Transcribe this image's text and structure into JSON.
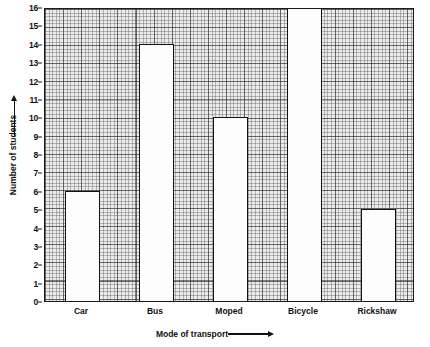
{
  "chart_data": {
    "type": "bar",
    "title": "",
    "categories": [
      "Car",
      "Bus",
      "Moped",
      "Bicycle",
      "Rickshaw"
    ],
    "values": [
      6,
      14,
      10,
      16,
      5
    ],
    "xlabel": "Mode of transport",
    "ylabel": "Number of students",
    "ylim": [
      0,
      16
    ],
    "ytick_labels": [
      "0",
      "1",
      "2",
      "3",
      "4",
      "5",
      "6",
      "7",
      "8",
      "9",
      "10",
      "11",
      "12",
      "13",
      "14",
      "15",
      "16"
    ],
    "grid": true,
    "legend": "none",
    "bar_fill_color": "#fdfdfd",
    "bar_edge_color": "#111111",
    "grid_background_color": "#ececec",
    "axis_color": "#1a1a1a"
  },
  "axes": {
    "y_arrow_icon": "up-arrow-icon",
    "x_arrow_icon": "right-arrow-icon"
  }
}
